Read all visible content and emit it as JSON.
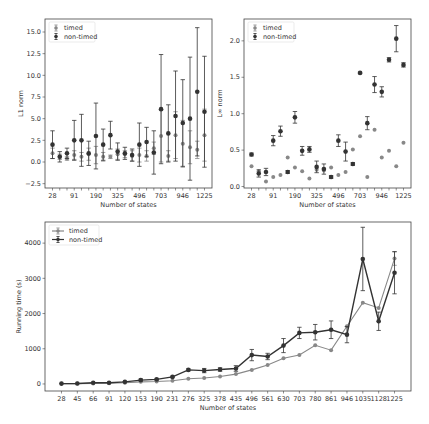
{
  "chart_data": [
    {
      "type": "scatter",
      "title": "",
      "xlabel": "Number of states",
      "ylabel": "L1 norm",
      "ylim": [
        -3,
        16.5
      ],
      "yticks": [
        -2.5,
        0.0,
        2.5,
        5.0,
        7.5,
        10.0,
        12.5,
        15.0
      ],
      "ytick_labels": [
        "−2.5",
        "0.0",
        "2.5",
        "5.0",
        "7.5",
        "10.0",
        "12.5",
        "15.0"
      ],
      "xtick_labels": [
        "28",
        "91",
        "190",
        "325",
        "496",
        "703",
        "946",
        "1225"
      ],
      "legend": [
        "timed",
        "non-timed"
      ],
      "legend_position": "upper left",
      "categories": [
        "28",
        "45",
        "66",
        "91",
        "120",
        "153",
        "190",
        "231",
        "276",
        "325",
        "378",
        "435",
        "496",
        "561",
        "630",
        "703",
        "780",
        "861",
        "946",
        "1035",
        "1128",
        "1225"
      ],
      "series": [
        {
          "name": "timed",
          "color": "#888888",
          "values": [
            1.0,
            0.6,
            0.4,
            0.8,
            0.6,
            0.9,
            0.8,
            0.6,
            0.6,
            0.9,
            0.9,
            0.7,
            0.8,
            0.7,
            1.6,
            3.0,
            0.7,
            3.1,
            2.1,
            1.7,
            1.4,
            3.1
          ],
          "err": [
            0.6,
            0.3,
            0.2,
            0.5,
            0.5,
            0.7,
            1.0,
            0.5,
            0.2,
            0.6,
            0.4,
            0.6,
            0.8,
            0.6,
            0.7,
            3.0,
            0.6,
            2.7,
            2.7,
            1.9,
            1.0,
            3.0
          ]
        },
        {
          "name": "non-timed",
          "color": "#333333",
          "values": [
            2.0,
            0.6,
            1.0,
            2.5,
            2.5,
            1.0,
            3.0,
            2.0,
            3.1,
            1.2,
            1.0,
            0.8,
            2.0,
            2.3,
            1.1,
            6.1,
            3.3,
            5.3,
            4.5,
            5.0,
            8.1,
            5.8
          ],
          "err": [
            1.6,
            0.6,
            0.6,
            2.3,
            3.0,
            1.4,
            3.8,
            1.8,
            1.6,
            1.0,
            0.7,
            0.7,
            2.5,
            1.7,
            2.5,
            6.3,
            3.3,
            5.2,
            5.0,
            7.1,
            7.4,
            6.4
          ]
        }
      ]
    },
    {
      "type": "scatter",
      "title": "",
      "xlabel": "Number of states",
      "ylabel": "L∞ norm",
      "ylim": [
        -0.02,
        2.3
      ],
      "yticks": [
        0.0,
        0.5,
        1.0,
        1.5,
        2.0
      ],
      "ytick_labels": [
        "0.0",
        "0.5",
        "1.0",
        "1.5",
        "2.0"
      ],
      "xtick_labels": [
        "28",
        "91",
        "190",
        "325",
        "496",
        "703",
        "946",
        "1225"
      ],
      "legend": [
        "timed",
        "non-timed"
      ],
      "legend_position": "upper left",
      "categories": [
        "28",
        "45",
        "66",
        "91",
        "120",
        "153",
        "190",
        "231",
        "276",
        "325",
        "378",
        "435",
        "496",
        "561",
        "630",
        "703",
        "780",
        "861",
        "946",
        "1035",
        "1128",
        "1225"
      ],
      "series": [
        {
          "name": "timed",
          "color": "#888888",
          "values": [
            0.28,
            0.21,
            0.07,
            0.13,
            0.16,
            0.4,
            0.26,
            0.21,
            0.11,
            0.23,
            0.22,
            0.26,
            0.16,
            0.2,
            0.51,
            0.69,
            0.13,
            0.78,
            0.4,
            0.49,
            0.28,
            0.6
          ],
          "err": [
            0,
            0,
            0,
            0,
            0,
            0,
            0,
            0,
            0,
            0,
            0,
            0,
            0,
            0,
            0,
            0,
            0,
            0,
            0,
            0,
            0,
            0
          ]
        },
        {
          "name": "non-timed",
          "color": "#333333",
          "values": [
            0.44,
            0.18,
            0.2,
            0.63,
            0.76,
            0.2,
            0.95,
            0.49,
            0.51,
            0.27,
            0.24,
            0.13,
            0.63,
            0.48,
            0.31,
            1.56,
            0.87,
            1.4,
            1.3,
            1.74,
            2.03,
            1.67
          ],
          "err": [
            0.02,
            0.05,
            0.05,
            0.07,
            0.07,
            0.02,
            0.08,
            0.06,
            0.04,
            0.08,
            0.07,
            0.02,
            0.08,
            0.13,
            0.02,
            0.01,
            0.09,
            0.11,
            0.07,
            0.03,
            0.18,
            0.03
          ]
        }
      ]
    },
    {
      "type": "line",
      "title": "",
      "xlabel": "Number of states",
      "ylabel": "Running time (s)",
      "ylim": [
        -200,
        4600
      ],
      "yticks": [
        0,
        1000,
        2000,
        3000,
        4000
      ],
      "ytick_labels": [
        "0",
        "1000",
        "2000",
        "3000",
        "4000"
      ],
      "legend": [
        "timed",
        "non-timed"
      ],
      "legend_position": "upper left",
      "categories": [
        "28",
        "45",
        "66",
        "91",
        "120",
        "153",
        "190",
        "231",
        "276",
        "325",
        "378",
        "435",
        "496",
        "561",
        "630",
        "703",
        "780",
        "861",
        "946",
        "1035",
        "1128",
        "1225"
      ],
      "series": [
        {
          "name": "timed",
          "color": "#888888",
          "values": [
            5,
            10,
            15,
            20,
            35,
            60,
            70,
            90,
            150,
            170,
            210,
            280,
            400,
            540,
            730,
            820,
            1100,
            960,
            1640,
            2310,
            2160,
            3560
          ],
          "err": [
            0,
            0,
            0,
            0,
            0,
            0,
            0,
            0,
            0,
            0,
            0,
            0,
            0,
            0,
            0,
            0,
            0,
            0,
            0,
            0,
            0,
            190
          ]
        },
        {
          "name": "non-timed",
          "color": "#333333",
          "values": [
            10,
            15,
            35,
            35,
            60,
            110,
            130,
            200,
            400,
            380,
            410,
            440,
            820,
            780,
            1090,
            1450,
            1470,
            1540,
            1400,
            3550,
            1780,
            3160
          ],
          "err": [
            0,
            0,
            0,
            0,
            10,
            30,
            20,
            20,
            30,
            60,
            50,
            80,
            160,
            90,
            200,
            160,
            220,
            250,
            230,
            900,
            260,
            600
          ]
        }
      ]
    }
  ]
}
